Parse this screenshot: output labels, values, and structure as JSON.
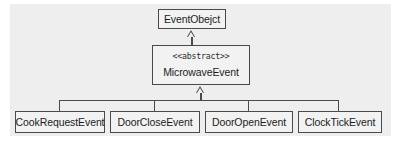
{
  "diagram": {
    "type": "uml-class-diagram",
    "title": "",
    "colors": {
      "page_background": "#eeeeee",
      "box_fill": "#f2f2f2",
      "box_border": "#4a4a4a",
      "connector": "#4a4a4a",
      "text": "#1c1c1c"
    },
    "root": {
      "name": "EventObejct",
      "stereotype": ""
    },
    "abstract": {
      "stereotype": "<<abstract>>",
      "name": "MicrowaveEvent"
    },
    "children": [
      {
        "name": "CookRequestEvent"
      },
      {
        "name": "DoorCloseEvent"
      },
      {
        "name": "DoorOpenEvent"
      },
      {
        "name": "ClockTickEvent"
      }
    ],
    "relations": [
      {
        "kind": "generalization",
        "from": "MicrowaveEvent",
        "to": "EventObejct",
        "arrow": "hollow-triangle"
      },
      {
        "kind": "generalization",
        "from": "CookRequestEvent",
        "to": "MicrowaveEvent",
        "arrow": "hollow-triangle"
      },
      {
        "kind": "generalization",
        "from": "DoorCloseEvent",
        "to": "MicrowaveEvent",
        "arrow": "hollow-triangle"
      },
      {
        "kind": "generalization",
        "from": "DoorOpenEvent",
        "to": "MicrowaveEvent",
        "arrow": "hollow-triangle"
      },
      {
        "kind": "generalization",
        "from": "ClockTickEvent",
        "to": "MicrowaveEvent",
        "arrow": "hollow-triangle"
      }
    ]
  }
}
